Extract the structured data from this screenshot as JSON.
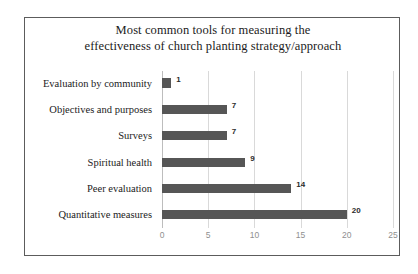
{
  "chart_data": {
    "type": "bar",
    "orientation": "horizontal",
    "title": "Most common tools for measuring the effectiveness of church planting strategy/approach",
    "title_lines": [
      "Most common tools for measuring  the",
      "effectiveness  of church planting  strategy/approach"
    ],
    "categories": [
      "Evaluation by community",
      "Objectives and purposes",
      "Surveys",
      "Spiritual health",
      "Peer evaluation",
      "Quantitative measures"
    ],
    "values": [
      1,
      7,
      7,
      9,
      14,
      20
    ],
    "data_labels": [
      "1",
      "7",
      "7",
      "9",
      "14",
      "20"
    ],
    "xlabel": "",
    "ylabel": "",
    "xlim": [
      0,
      25
    ],
    "xticks": [
      0,
      5,
      10,
      15,
      20,
      25
    ],
    "xtick_labels": [
      "0",
      "5",
      "10",
      "15",
      "20",
      "25"
    ],
    "grid": true,
    "grid_axis": "x",
    "legend": false,
    "colors": {
      "bar_fill": "#565656",
      "gridline": "#d9d9d9",
      "frame_border": "#5c5c5c",
      "title_text": "#1b1b1b",
      "category_text": "#1b1b1b",
      "tick_text": "#8f8f8f",
      "data_label_text": "#2b2b2b",
      "background": "#ffffff"
    }
  }
}
